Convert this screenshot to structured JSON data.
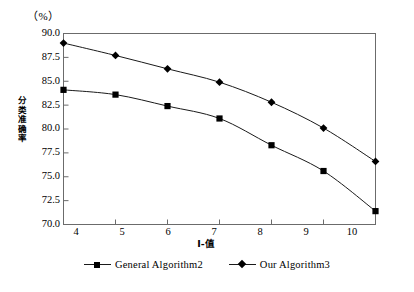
{
  "chart_data": {
    "type": "line",
    "title": "",
    "subtitle": "",
    "unit_label": "（%）",
    "xlabel": "I-值",
    "ylabel": "分类准确率",
    "ylabel_chars": [
      "分",
      "类",
      "准",
      "确",
      "率"
    ],
    "x": [
      4,
      5,
      6,
      7,
      8,
      9,
      10
    ],
    "categories": [
      "4",
      "5",
      "6",
      "7",
      "8",
      "9",
      "10"
    ],
    "xtick_labels": [
      "4",
      "5",
      "6",
      "7",
      "8",
      "9",
      "10"
    ],
    "ytick_labels": [
      "90.0",
      "87.5",
      "85.0",
      "82.5",
      "80.0",
      "77.5",
      "75.0",
      "72.5",
      "70.0"
    ],
    "ytick_values": [
      90.0,
      87.5,
      85.0,
      82.5,
      80.0,
      77.5,
      75.0,
      72.5,
      70.0
    ],
    "xlim": [
      4,
      10
    ],
    "ylim": [
      70.0,
      90.0
    ],
    "grid": false,
    "legend_position": "bottom-center",
    "series": [
      {
        "name": "General Algorithm2",
        "marker": "square",
        "color": "#000000",
        "values": [
          84.1,
          83.6,
          82.4,
          81.1,
          78.3,
          75.6,
          71.4
        ]
      },
      {
        "name": "Our Algorithm3",
        "marker": "diamond",
        "color": "#000000",
        "values": [
          89.0,
          87.7,
          86.3,
          84.9,
          82.8,
          80.1,
          76.6
        ]
      }
    ]
  },
  "legend": {
    "entries": [
      {
        "label": "General Algorithm2",
        "marker": "square-marker"
      },
      {
        "label": "Our Algorithm3",
        "marker": "diamond-marker"
      }
    ]
  },
  "colors": {
    "axis": "#6b6b6b",
    "line": "#1a1a1a",
    "marker": "#000000",
    "background": "#ffffff",
    "text": "#000000"
  }
}
